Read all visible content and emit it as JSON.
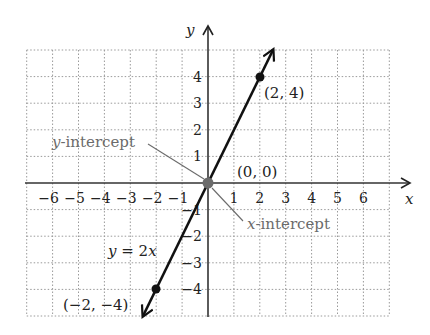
{
  "chart_data": {
    "type": "line",
    "title": "",
    "xlabel": "x",
    "ylabel": "y",
    "xlim": [
      -7,
      7
    ],
    "ylim": [
      -5,
      5
    ],
    "grid": true,
    "x_ticks": [
      "−6",
      "−5",
      "−4",
      "−3",
      "−2",
      "−1",
      "1",
      "2",
      "3",
      "4",
      "5",
      "6"
    ],
    "y_ticks": [
      "4",
      "3",
      "2",
      "1",
      "−1",
      "−2",
      "−3",
      "−4"
    ],
    "series": [
      {
        "name": "y = 2x",
        "equation": "y = 2x",
        "slope": 2,
        "intercept": 0,
        "x": [
          -2.5,
          -2,
          0,
          2,
          2.5
        ],
        "y": [
          -5,
          -4,
          0,
          4,
          5
        ]
      }
    ],
    "points": [
      {
        "label": "(2, 4)",
        "x": 2,
        "y": 4
      },
      {
        "label": "(0, 0)",
        "x": 0,
        "y": 0
      },
      {
        "label": "(−2, −4)",
        "x": -2,
        "y": -4
      }
    ],
    "annotations": [
      {
        "text_var": "y",
        "text_rest": "-intercept",
        "points_to": [
          0,
          0
        ]
      },
      {
        "text_var": "x",
        "text_rest": "-intercept",
        "points_to": [
          0,
          0
        ]
      }
    ]
  },
  "labels": {
    "x_axis": "x",
    "y_axis": "y",
    "equation_lhs": "y",
    "equation_eq": " = 2",
    "equation_var": "x",
    "point_2_4": "(2, 4)",
    "point_origin": "(0, 0)",
    "point_neg2_neg4": "(−2, −4)",
    "y_intercept_var": "y",
    "y_intercept_rest": "-intercept",
    "x_intercept_var": "x",
    "x_intercept_rest": "-intercept"
  },
  "colors": {
    "line": "#111111",
    "axis": "#333333",
    "grid": "#9a9a9a",
    "annotation": "#6b6b6b",
    "origin_dot": "#6b6b6b"
  }
}
